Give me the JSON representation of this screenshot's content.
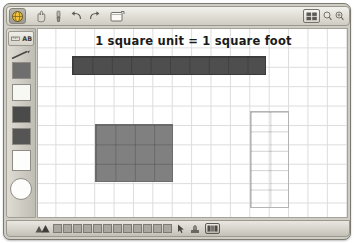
{
  "window": {
    "accent_color": "#cfcdc4",
    "frame_border": "#7a7a72"
  },
  "toolbar": {
    "buttons": [
      {
        "name": "app-menu-button",
        "icon": "globe-icon",
        "selected": true
      },
      {
        "name": "select-tool-button",
        "icon": "hand-icon",
        "selected": false
      },
      {
        "name": "paint-tool-button",
        "icon": "brush-icon",
        "selected": false
      },
      {
        "name": "undo-button",
        "icon": "undo-arrow-icon",
        "selected": false
      },
      {
        "name": "redo-button",
        "icon": "redo-arrow-icon",
        "selected": false
      },
      {
        "name": "open-file-button",
        "icon": "folder-icon",
        "selected": false
      }
    ],
    "grid_toggle": {
      "name": "grid-toggle-button",
      "icon": "grid-icon"
    },
    "zoom_out": {
      "name": "zoom-out-button",
      "icon": "magnifier-minus-icon"
    },
    "zoom_in": {
      "name": "zoom-in-button",
      "icon": "magnifier-plus-icon"
    }
  },
  "palette": {
    "tool_buttons": [
      {
        "name": "ruler-tool",
        "icon": "ruler-icon"
      },
      {
        "name": "text-tool",
        "icon": "text-abc-icon"
      }
    ],
    "pencil": {
      "name": "pencil-tool",
      "icon": "pencil-icon"
    },
    "swatches": [
      {
        "name": "color-swatch-dark-gray",
        "color": "#6e6e6e"
      },
      {
        "name": "color-swatch-white",
        "color": "#f7f7f4"
      },
      {
        "name": "color-swatch-charcoal",
        "color": "#4a4a4a"
      },
      {
        "name": "color-swatch-graphite",
        "color": "#555555"
      },
      {
        "name": "color-swatch-blank",
        "color": "#fdfdfb"
      }
    ],
    "circle_swatch": {
      "name": "ellipse-tool",
      "color": "#fdfdfb"
    }
  },
  "canvas": {
    "title": "1 square unit = 1 square foot",
    "grid": {
      "cell_px": 19.4,
      "line_color": "#dcdcdc",
      "background": "#ffffff"
    },
    "shapes": [
      {
        "name": "shape-horizontal-rectangle",
        "style": "filled",
        "fill": "#4e4e4e",
        "border": "#3a3a3a",
        "left": 34,
        "top": 27,
        "width_units": 10,
        "height_units": 1,
        "area_units": 10
      },
      {
        "name": "shape-medium-rectangle",
        "style": "filled",
        "fill": "#808080",
        "border": "#6b6b6b",
        "left": 57,
        "top": 95,
        "width_units": 4,
        "height_units": 3,
        "area_units": 12
      },
      {
        "name": "shape-tall-outline-rectangle",
        "style": "outline",
        "fill": "transparent",
        "border": "#b4b4b4",
        "left": 212,
        "top": 82,
        "width_units": 2,
        "height_units": 5,
        "area_units": 10
      }
    ]
  },
  "statusbar": {
    "mountain_icon": {
      "name": "terrain-icon"
    },
    "swatches": [
      {
        "name": "status-swatch-1",
        "color": "#a9a7a0"
      },
      {
        "name": "status-swatch-2",
        "color": "#a9a7a0"
      },
      {
        "name": "status-swatch-3",
        "color": "#a9a7a0"
      },
      {
        "name": "status-swatch-4",
        "color": "#a9a7a0"
      },
      {
        "name": "status-swatch-5",
        "color": "#a9a7a0"
      },
      {
        "name": "status-swatch-6",
        "color": "#a9a7a0"
      },
      {
        "name": "status-swatch-7",
        "color": "#a9a7a0"
      },
      {
        "name": "status-swatch-8",
        "color": "#a9a7a0"
      },
      {
        "name": "status-swatch-9",
        "color": "#a9a7a0"
      },
      {
        "name": "status-swatch-10",
        "color": "#a9a7a0"
      },
      {
        "name": "status-swatch-11",
        "color": "#a9a7a0"
      },
      {
        "name": "status-swatch-12",
        "color": "#a9a7a0"
      }
    ],
    "pointer_icon": {
      "name": "cursor-arrow-icon"
    },
    "stamp_icon": {
      "name": "stamp-icon"
    },
    "display_button": {
      "name": "display-mode-button",
      "icon": "layout-icon"
    }
  }
}
